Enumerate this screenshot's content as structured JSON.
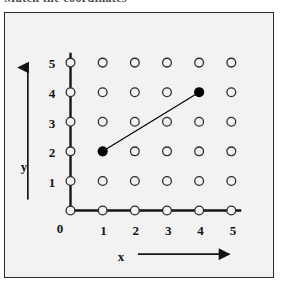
{
  "scan": {
    "top_cropped_text": "Match the coordinates"
  },
  "figure": {
    "background_color": "#f3f2f0",
    "frame_color": "#2b2b2b",
    "grid_dot_color": "#2b2b2b",
    "axis_color": "#141414",
    "marked_point_color": "#000000"
  },
  "chart_data": {
    "type": "scatter",
    "title": "",
    "xlabel": "x",
    "ylabel": "y",
    "xlim": [
      0,
      5
    ],
    "ylim": [
      0,
      5
    ],
    "xticks": [
      0,
      1,
      2,
      3,
      4,
      5
    ],
    "yticks": [
      0,
      1,
      2,
      3,
      4,
      5
    ],
    "xtick_labels": [
      "0",
      "1",
      "2",
      "3",
      "4",
      "5"
    ],
    "ytick_labels": [
      "0",
      "1",
      "2",
      "3",
      "4",
      "5"
    ],
    "grid": true,
    "grid_style": "lattice of open circles at every integer coordinate pair",
    "legend": null,
    "axes_have_arrowheads": true,
    "lattice_points": [
      {
        "x": 0,
        "y": 0,
        "filled": false
      },
      {
        "x": 1,
        "y": 0,
        "filled": false
      },
      {
        "x": 2,
        "y": 0,
        "filled": false
      },
      {
        "x": 3,
        "y": 0,
        "filled": false
      },
      {
        "x": 4,
        "y": 0,
        "filled": false
      },
      {
        "x": 5,
        "y": 0,
        "filled": false
      },
      {
        "x": 0,
        "y": 1,
        "filled": false
      },
      {
        "x": 1,
        "y": 1,
        "filled": false
      },
      {
        "x": 2,
        "y": 1,
        "filled": false
      },
      {
        "x": 3,
        "y": 1,
        "filled": false
      },
      {
        "x": 4,
        "y": 1,
        "filled": false
      },
      {
        "x": 5,
        "y": 1,
        "filled": false
      },
      {
        "x": 0,
        "y": 2,
        "filled": false
      },
      {
        "x": 1,
        "y": 2,
        "filled": true
      },
      {
        "x": 2,
        "y": 2,
        "filled": false
      },
      {
        "x": 3,
        "y": 2,
        "filled": false
      },
      {
        "x": 4,
        "y": 2,
        "filled": false
      },
      {
        "x": 5,
        "y": 2,
        "filled": false
      },
      {
        "x": 0,
        "y": 3,
        "filled": false
      },
      {
        "x": 1,
        "y": 3,
        "filled": false
      },
      {
        "x": 2,
        "y": 3,
        "filled": false
      },
      {
        "x": 3,
        "y": 3,
        "filled": false
      },
      {
        "x": 4,
        "y": 3,
        "filled": false
      },
      {
        "x": 5,
        "y": 3,
        "filled": false
      },
      {
        "x": 0,
        "y": 4,
        "filled": false
      },
      {
        "x": 1,
        "y": 4,
        "filled": false
      },
      {
        "x": 2,
        "y": 4,
        "filled": false
      },
      {
        "x": 3,
        "y": 4,
        "filled": false
      },
      {
        "x": 4,
        "y": 4,
        "filled": true
      },
      {
        "x": 5,
        "y": 4,
        "filled": false
      },
      {
        "x": 0,
        "y": 5,
        "filled": false
      },
      {
        "x": 1,
        "y": 5,
        "filled": false
      },
      {
        "x": 2,
        "y": 5,
        "filled": false
      },
      {
        "x": 3,
        "y": 5,
        "filled": false
      },
      {
        "x": 4,
        "y": 5,
        "filled": false
      },
      {
        "x": 5,
        "y": 5,
        "filled": false
      }
    ],
    "marked_points": [
      {
        "x": 1,
        "y": 2
      },
      {
        "x": 4,
        "y": 4
      }
    ],
    "segments": [
      {
        "from": {
          "x": 1,
          "y": 2
        },
        "to": {
          "x": 4,
          "y": 4
        }
      }
    ]
  }
}
